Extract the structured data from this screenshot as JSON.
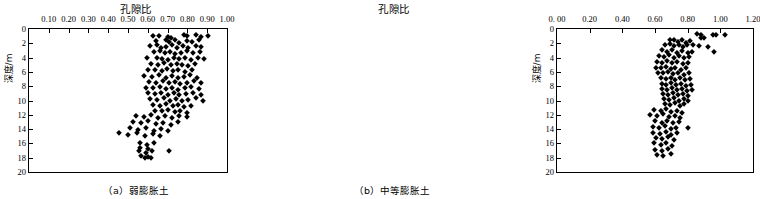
{
  "figure": {
    "panels": [
      {
        "id": "a",
        "caption": "（a）弱膨胀土",
        "title": "孔隙比",
        "ylabel": "深度/m"
      },
      {
        "id": "b",
        "caption": "（b）中等膨胀土",
        "title": "孔隙比",
        "ylabel": "深度/m"
      }
    ]
  },
  "chart_data": [
    {
      "type": "scatter",
      "title": "孔隙比",
      "subtitle": "（a）弱膨胀土",
      "xlabel": "孔隙比",
      "ylabel": "深度/m",
      "xaxis_position": "top",
      "yaxis_inverted": true,
      "xlim": [
        0.0,
        1.0
      ],
      "ylim": [
        0,
        20
      ],
      "xticks": [
        0.0,
        0.1,
        0.2,
        0.3,
        0.4,
        0.5,
        0.6,
        0.7,
        0.8,
        0.9,
        1.0
      ],
      "xticklabels": [
        "",
        "0.10",
        "0.20",
        "0.30",
        "0.40",
        "0.50",
        "0.60",
        "0.70",
        "0.80",
        "0.90",
        "1.00"
      ],
      "yticks": [
        0,
        2,
        4,
        6,
        8,
        10,
        12,
        14,
        16,
        18,
        20
      ],
      "yticklabels": [
        "0",
        "2",
        "4",
        "6",
        "8",
        "10",
        "12",
        "14",
        "16",
        "18",
        "20"
      ],
      "grid": false,
      "legend": null,
      "marker": "diamond",
      "marker_color": "#000000",
      "points": [
        [
          0.625,
          1.0
        ],
        [
          0.655,
          1.0
        ],
        [
          0.7,
          1.1
        ],
        [
          0.715,
          1.2
        ],
        [
          0.785,
          0.9
        ],
        [
          0.8,
          1.0
        ],
        [
          0.845,
          0.8
        ],
        [
          0.87,
          1.1
        ],
        [
          0.905,
          1.0
        ],
        [
          0.64,
          1.7
        ],
        [
          0.69,
          1.6
        ],
        [
          0.705,
          1.8
        ],
        [
          0.735,
          1.6
        ],
        [
          0.76,
          1.9
        ],
        [
          0.8,
          1.7
        ],
        [
          0.825,
          1.8
        ],
        [
          0.86,
          1.6
        ],
        [
          0.61,
          2.4
        ],
        [
          0.645,
          2.3
        ],
        [
          0.665,
          2.6
        ],
        [
          0.69,
          2.5
        ],
        [
          0.72,
          2.3
        ],
        [
          0.745,
          2.7
        ],
        [
          0.78,
          2.4
        ],
        [
          0.805,
          2.6
        ],
        [
          0.845,
          2.4
        ],
        [
          0.87,
          2.5
        ],
        [
          0.63,
          3.2
        ],
        [
          0.66,
          3.1
        ],
        [
          0.685,
          3.4
        ],
        [
          0.71,
          3.2
        ],
        [
          0.735,
          3.5
        ],
        [
          0.77,
          3.3
        ],
        [
          0.8,
          3.1
        ],
        [
          0.83,
          3.4
        ],
        [
          0.865,
          3.2
        ],
        [
          0.595,
          4.1
        ],
        [
          0.645,
          4.0
        ],
        [
          0.67,
          4.2
        ],
        [
          0.7,
          4.3
        ],
        [
          0.73,
          4.0
        ],
        [
          0.76,
          4.2
        ],
        [
          0.79,
          4.1
        ],
        [
          0.82,
          4.3
        ],
        [
          0.855,
          4.0
        ],
        [
          0.885,
          4.2
        ],
        [
          0.615,
          4.9
        ],
        [
          0.65,
          5.0
        ],
        [
          0.68,
          4.8
        ],
        [
          0.715,
          5.1
        ],
        [
          0.745,
          4.9
        ],
        [
          0.775,
          5.0
        ],
        [
          0.805,
          5.2
        ],
        [
          0.84,
          4.9
        ],
        [
          0.6,
          5.8
        ],
        [
          0.635,
          5.7
        ],
        [
          0.67,
          5.9
        ],
        [
          0.695,
          5.6
        ],
        [
          0.725,
          5.9
        ],
        [
          0.755,
          5.7
        ],
        [
          0.79,
          6.0
        ],
        [
          0.825,
          5.8
        ],
        [
          0.58,
          6.6
        ],
        [
          0.62,
          6.7
        ],
        [
          0.655,
          6.5
        ],
        [
          0.69,
          6.8
        ],
        [
          0.72,
          6.6
        ],
        [
          0.75,
          6.9
        ],
        [
          0.785,
          6.7
        ],
        [
          0.815,
          6.5
        ],
        [
          0.85,
          6.8
        ],
        [
          0.605,
          7.4
        ],
        [
          0.64,
          7.5
        ],
        [
          0.675,
          7.3
        ],
        [
          0.705,
          7.6
        ],
        [
          0.735,
          7.4
        ],
        [
          0.765,
          7.7
        ],
        [
          0.8,
          7.5
        ],
        [
          0.835,
          7.3
        ],
        [
          0.87,
          7.6
        ],
        [
          0.59,
          8.2
        ],
        [
          0.625,
          8.3
        ],
        [
          0.66,
          8.1
        ],
        [
          0.69,
          8.4
        ],
        [
          0.72,
          8.2
        ],
        [
          0.755,
          8.5
        ],
        [
          0.79,
          8.3
        ],
        [
          0.82,
          8.1
        ],
        [
          0.86,
          8.4
        ],
        [
          0.6,
          9.0
        ],
        [
          0.635,
          9.1
        ],
        [
          0.665,
          8.9
        ],
        [
          0.7,
          9.2
        ],
        [
          0.73,
          9.0
        ],
        [
          0.76,
          9.3
        ],
        [
          0.795,
          9.1
        ],
        [
          0.83,
          8.9
        ],
        [
          0.87,
          9.2
        ],
        [
          0.61,
          9.8
        ],
        [
          0.645,
          9.9
        ],
        [
          0.68,
          9.7
        ],
        [
          0.71,
          10.0
        ],
        [
          0.74,
          9.8
        ],
        [
          0.775,
          10.1
        ],
        [
          0.805,
          9.9
        ],
        [
          0.845,
          9.7
        ],
        [
          0.88,
          10.0
        ],
        [
          0.625,
          10.6
        ],
        [
          0.66,
          10.7
        ],
        [
          0.69,
          10.5
        ],
        [
          0.725,
          10.8
        ],
        [
          0.755,
          10.6
        ],
        [
          0.785,
          10.9
        ],
        [
          0.82,
          10.7
        ],
        [
          0.635,
          11.4
        ],
        [
          0.67,
          11.5
        ],
        [
          0.7,
          11.3
        ],
        [
          0.735,
          11.6
        ],
        [
          0.765,
          11.4
        ],
        [
          0.8,
          11.7
        ],
        [
          0.54,
          12.1
        ],
        [
          0.58,
          12.3
        ],
        [
          0.615,
          12.0
        ],
        [
          0.65,
          12.4
        ],
        [
          0.685,
          12.2
        ],
        [
          0.72,
          12.5
        ],
        [
          0.76,
          12.1
        ],
        [
          0.8,
          12.3
        ],
        [
          0.525,
          13.0
        ],
        [
          0.565,
          13.2
        ],
        [
          0.6,
          12.9
        ],
        [
          0.64,
          13.3
        ],
        [
          0.675,
          13.1
        ],
        [
          0.715,
          13.4
        ],
        [
          0.755,
          13.0
        ],
        [
          0.51,
          13.9
        ],
        [
          0.55,
          14.1
        ],
        [
          0.59,
          13.8
        ],
        [
          0.63,
          14.2
        ],
        [
          0.665,
          14.0
        ],
        [
          0.7,
          14.3
        ],
        [
          0.455,
          14.6
        ],
        [
          0.5,
          14.8
        ],
        [
          0.545,
          14.5
        ],
        [
          0.585,
          14.9
        ],
        [
          0.625,
          14.7
        ],
        [
          0.66,
          15.0
        ],
        [
          0.56,
          16.0
        ],
        [
          0.595,
          16.2
        ],
        [
          0.63,
          15.9
        ],
        [
          0.56,
          16.6
        ],
        [
          0.6,
          16.8
        ],
        [
          0.555,
          17.1
        ],
        [
          0.59,
          17.3
        ],
        [
          0.62,
          17.0
        ],
        [
          0.705,
          17.0
        ],
        [
          0.565,
          17.8
        ],
        [
          0.6,
          17.9
        ],
        [
          0.585,
          18.1
        ],
        [
          0.615,
          18.0
        ]
      ]
    },
    {
      "type": "scatter",
      "title": "孔隙比",
      "subtitle": "（b）中等膨胀土",
      "xlabel": "孔隙比",
      "ylabel": "深度/m",
      "xaxis_position": "top",
      "yaxis_inverted": true,
      "xlim": [
        0.0,
        1.2
      ],
      "ylim": [
        0,
        20
      ],
      "xticks": [
        0.0,
        0.2,
        0.4,
        0.6,
        0.8,
        1.0,
        1.2
      ],
      "xticklabels": [
        "0. 00",
        "0.20",
        "0.40",
        "0.60",
        "0.80",
        "1.00",
        "1.20"
      ],
      "yticks": [
        0,
        2,
        4,
        6,
        8,
        10,
        12,
        14,
        16,
        18,
        20
      ],
      "yticklabels": [
        "0",
        "2",
        "4",
        "6",
        "8",
        "10",
        "12",
        "14",
        "16",
        "18",
        "20"
      ],
      "grid": false,
      "legend": null,
      "marker": "diamond",
      "marker_color": "#000000",
      "points": [
        [
          0.86,
          0.7
        ],
        [
          0.88,
          0.9
        ],
        [
          0.955,
          0.8
        ],
        [
          0.975,
          0.8
        ],
        [
          1.03,
          0.8
        ],
        [
          0.88,
          1.2
        ],
        [
          0.9,
          1.3
        ],
        [
          0.69,
          1.6
        ],
        [
          0.715,
          1.5
        ],
        [
          0.74,
          1.8
        ],
        [
          0.765,
          1.6
        ],
        [
          0.79,
          1.9
        ],
        [
          0.815,
          1.7
        ],
        [
          0.66,
          2.2
        ],
        [
          0.69,
          2.1
        ],
        [
          0.715,
          2.4
        ],
        [
          0.745,
          2.2
        ],
        [
          0.77,
          2.5
        ],
        [
          0.795,
          2.3
        ],
        [
          0.83,
          2.2
        ],
        [
          0.87,
          2.4
        ],
        [
          0.925,
          2.5
        ],
        [
          0.645,
          3.0
        ],
        [
          0.675,
          3.2
        ],
        [
          0.705,
          3.0
        ],
        [
          0.735,
          3.3
        ],
        [
          0.765,
          3.1
        ],
        [
          0.8,
          3.4
        ],
        [
          0.825,
          3.2
        ],
        [
          0.96,
          3.2
        ],
        [
          0.625,
          3.8
        ],
        [
          0.655,
          3.9
        ],
        [
          0.685,
          3.7
        ],
        [
          0.715,
          4.0
        ],
        [
          0.745,
          3.8
        ],
        [
          0.775,
          4.1
        ],
        [
          0.81,
          3.9
        ],
        [
          0.615,
          4.6
        ],
        [
          0.645,
          4.7
        ],
        [
          0.675,
          4.5
        ],
        [
          0.705,
          4.8
        ],
        [
          0.735,
          4.6
        ],
        [
          0.77,
          4.9
        ],
        [
          0.8,
          4.7
        ],
        [
          0.605,
          5.4
        ],
        [
          0.635,
          5.5
        ],
        [
          0.665,
          5.3
        ],
        [
          0.695,
          5.6
        ],
        [
          0.725,
          5.4
        ],
        [
          0.76,
          5.7
        ],
        [
          0.79,
          5.5
        ],
        [
          0.62,
          6.1
        ],
        [
          0.65,
          6.2
        ],
        [
          0.68,
          6.0
        ],
        [
          0.71,
          6.3
        ],
        [
          0.74,
          6.1
        ],
        [
          0.775,
          6.4
        ],
        [
          0.81,
          6.2
        ],
        [
          0.635,
          6.9
        ],
        [
          0.665,
          7.0
        ],
        [
          0.695,
          6.8
        ],
        [
          0.725,
          7.1
        ],
        [
          0.755,
          6.9
        ],
        [
          0.785,
          7.2
        ],
        [
          0.815,
          7.0
        ],
        [
          0.64,
          7.7
        ],
        [
          0.67,
          7.8
        ],
        [
          0.7,
          7.6
        ],
        [
          0.73,
          7.9
        ],
        [
          0.76,
          7.7
        ],
        [
          0.79,
          8.0
        ],
        [
          0.82,
          7.8
        ],
        [
          0.645,
          8.4
        ],
        [
          0.675,
          8.5
        ],
        [
          0.705,
          8.3
        ],
        [
          0.735,
          8.6
        ],
        [
          0.765,
          8.4
        ],
        [
          0.795,
          8.7
        ],
        [
          0.825,
          8.5
        ],
        [
          0.65,
          9.1
        ],
        [
          0.68,
          9.2
        ],
        [
          0.71,
          9.0
        ],
        [
          0.74,
          9.3
        ],
        [
          0.77,
          9.1
        ],
        [
          0.8,
          9.4
        ],
        [
          0.655,
          9.8
        ],
        [
          0.685,
          9.9
        ],
        [
          0.715,
          9.7
        ],
        [
          0.745,
          10.0
        ],
        [
          0.775,
          9.8
        ],
        [
          0.805,
          10.1
        ],
        [
          0.66,
          10.5
        ],
        [
          0.69,
          10.6
        ],
        [
          0.72,
          10.4
        ],
        [
          0.75,
          10.7
        ],
        [
          0.78,
          10.5
        ],
        [
          0.595,
          11.3
        ],
        [
          0.635,
          11.5
        ],
        [
          0.67,
          11.2
        ],
        [
          0.7,
          11.6
        ],
        [
          0.735,
          11.4
        ],
        [
          0.765,
          11.7
        ],
        [
          0.57,
          12.0
        ],
        [
          0.61,
          12.2
        ],
        [
          0.65,
          11.9
        ],
        [
          0.685,
          12.3
        ],
        [
          0.72,
          12.1
        ],
        [
          0.755,
          12.4
        ],
        [
          0.6,
          12.9
        ],
        [
          0.64,
          13.1
        ],
        [
          0.675,
          12.8
        ],
        [
          0.71,
          13.2
        ],
        [
          0.745,
          13.0
        ],
        [
          0.585,
          13.7
        ],
        [
          0.625,
          13.9
        ],
        [
          0.66,
          13.6
        ],
        [
          0.695,
          14.0
        ],
        [
          0.73,
          13.8
        ],
        [
          0.8,
          13.9
        ],
        [
          0.59,
          14.5
        ],
        [
          0.63,
          14.7
        ],
        [
          0.665,
          14.4
        ],
        [
          0.7,
          14.8
        ],
        [
          0.735,
          14.6
        ],
        [
          0.605,
          15.2
        ],
        [
          0.645,
          15.4
        ],
        [
          0.68,
          15.1
        ],
        [
          0.715,
          15.5
        ],
        [
          0.595,
          16.0
        ],
        [
          0.635,
          16.2
        ],
        [
          0.67,
          15.9
        ],
        [
          0.705,
          16.3
        ],
        [
          0.6,
          16.9
        ],
        [
          0.64,
          17.1
        ],
        [
          0.68,
          16.8
        ],
        [
          0.61,
          17.6
        ],
        [
          0.65,
          17.8
        ],
        [
          0.7,
          17.5
        ]
      ]
    }
  ]
}
